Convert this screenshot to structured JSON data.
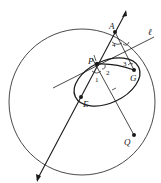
{
  "diagram": {
    "type": "geometry",
    "labels": {
      "A": "A",
      "P": "P",
      "G": "G",
      "E": "E",
      "Q": "Q",
      "ell": "ℓ",
      "angle1": "1",
      "angle2": "2",
      "angle3": "3",
      "angle4": "4"
    },
    "colors": {
      "stroke": "#1a1a1a",
      "background": "#ffffff"
    }
  }
}
